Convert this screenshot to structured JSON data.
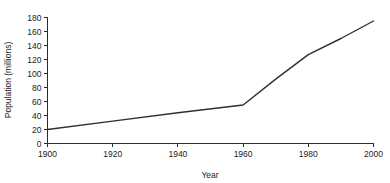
{
  "chart_data": {
    "type": "line",
    "title": "",
    "xlabel": "Year",
    "ylabel": "Population (millions)",
    "xlim": [
      1900,
      2000
    ],
    "ylim": [
      0,
      180
    ],
    "xticks": [
      1900,
      1920,
      1940,
      1960,
      1980,
      2000
    ],
    "xticklabels": [
      "1900",
      "1920",
      "1940",
      "1960",
      "1980",
      "2000"
    ],
    "yticks": [
      0,
      20,
      40,
      60,
      80,
      100,
      120,
      140,
      160,
      180
    ],
    "yticklabels": [
      "0",
      "20",
      "40",
      "60",
      "80",
      "100",
      "120",
      "140",
      "160",
      "180"
    ],
    "grid": false,
    "legend": false,
    "line_color": "#2e2e33",
    "background_color": "#ffffff",
    "x": [
      1900,
      1920,
      1940,
      1960,
      1970,
      1980,
      1990,
      2000
    ],
    "series": [
      {
        "name": "Population",
        "values": [
          20,
          32,
          44,
          55,
          92,
          127,
          150,
          175
        ]
      }
    ]
  }
}
